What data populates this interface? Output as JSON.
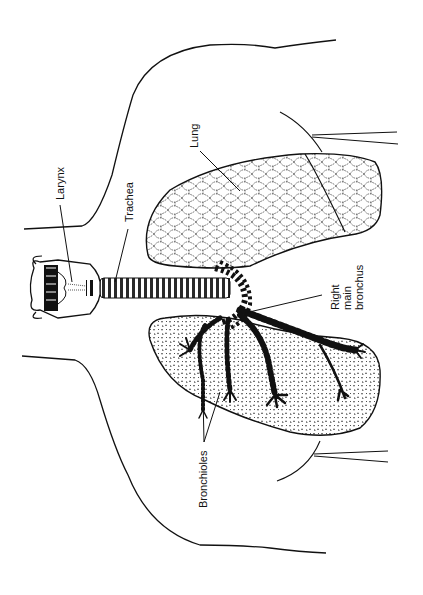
{
  "diagram": {
    "orientation": "rotated 90 degrees counterclockwise",
    "colors": {
      "ink": "#111111",
      "background": "#ffffff"
    },
    "labels": {
      "larynx": "Larynx",
      "trachea": "Trachea",
      "lung": "Lung",
      "right_main_bronchus_line1": "Right",
      "right_main_bronchus_line2": "main",
      "right_main_bronchus_line3": "bronchus",
      "bronchioles": "Bronchioles"
    },
    "structures": [
      "body-outline",
      "larynx",
      "trachea",
      "left-lung-upper",
      "right-lung-lower",
      "right-main-bronchus",
      "bronchioles",
      "clavicle-lines"
    ]
  }
}
